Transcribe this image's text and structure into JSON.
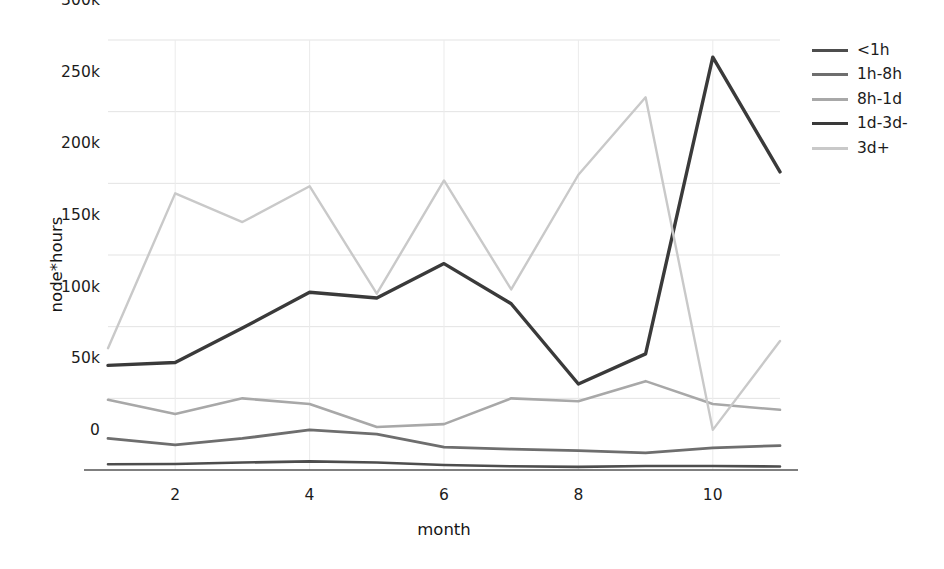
{
  "chart_data": {
    "type": "line",
    "title": "",
    "xlabel": "month",
    "ylabel": "node*hours",
    "x": [
      1,
      2,
      3,
      4,
      5,
      6,
      7,
      8,
      9,
      10,
      11
    ],
    "xlim": [
      1,
      11
    ],
    "ylim": [
      0,
      300000
    ],
    "xticks": [
      2,
      4,
      6,
      8,
      10
    ],
    "xticklabels": [
      "2",
      "4",
      "6",
      "8",
      "10"
    ],
    "yticks": [
      0,
      50000,
      100000,
      150000,
      200000,
      250000,
      300000
    ],
    "yticklabels": [
      "0",
      "50k",
      "100k",
      "150k",
      "200k",
      "250k",
      "300k"
    ],
    "grid": true,
    "legend_position": "right",
    "series": [
      {
        "name": "<1h",
        "color": "#4d4d4d",
        "width": 2.6,
        "values": [
          4000,
          4200,
          5200,
          6000,
          5200,
          3500,
          2600,
          2200,
          2800,
          2800,
          2400
        ]
      },
      {
        "name": "1h-8h",
        "color": "#6e6e6e",
        "width": 2.8,
        "values": [
          22000,
          17500,
          22000,
          28000,
          25000,
          16000,
          14500,
          13500,
          12000,
          15500,
          17000
        ]
      },
      {
        "name": "8h-1d",
        "color": "#a8a8a8",
        "width": 2.6,
        "values": [
          49000,
          39000,
          50000,
          46000,
          30000,
          32000,
          50000,
          48000,
          62000,
          46000,
          42000
        ]
      },
      {
        "name": "1d-3d-",
        "color": "#3a3a3a",
        "width": 3.4,
        "values": [
          73000,
          75000,
          99000,
          124000,
          120000,
          144000,
          116000,
          60000,
          81000,
          288000,
          208000
        ]
      },
      {
        "name": "3d+",
        "color": "#c9c9c9",
        "width": 2.4,
        "values": [
          85000,
          193000,
          173000,
          198000,
          123000,
          202000,
          126000,
          206000,
          260000,
          28000,
          90000
        ]
      }
    ]
  }
}
